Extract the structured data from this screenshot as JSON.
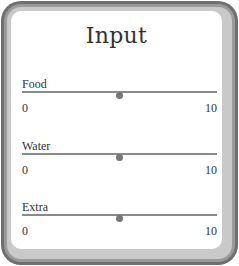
{
  "panel": {
    "title": "Input"
  },
  "sliders": [
    {
      "label": "Food",
      "min": "0",
      "max": "10",
      "value": 5
    },
    {
      "label": "Water",
      "min": "0",
      "max": "10",
      "value": 5
    },
    {
      "label": "Extra",
      "min": "0",
      "max": "10",
      "value": 5
    }
  ],
  "colors": {
    "frame_outer": "#6f6f6f",
    "frame_inner": "#c9c9c9",
    "track": "#8a8a8a",
    "thumb": "#777777",
    "text": "#333333"
  }
}
